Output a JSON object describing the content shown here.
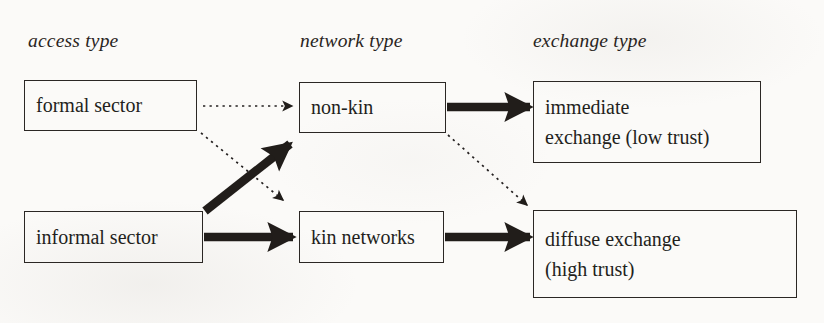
{
  "figure": {
    "background_color": "#fbfaf8",
    "ink_color": "#231f1c"
  },
  "columns": [
    {
      "label": "access type",
      "name": "access-type"
    },
    {
      "label": "network type",
      "name": "network-type"
    },
    {
      "label": "exchange type",
      "name": "exchange-type"
    }
  ],
  "nodes": [
    {
      "id": "formal-sector",
      "lines": [
        "formal sector"
      ],
      "column": "access type"
    },
    {
      "id": "informal-sector",
      "lines": [
        "informal sector"
      ],
      "column": "access type"
    },
    {
      "id": "non-kin",
      "lines": [
        "non-kin"
      ],
      "column": "network type"
    },
    {
      "id": "kin-networks",
      "lines": [
        "kin networks"
      ],
      "column": "network type"
    },
    {
      "id": "immediate-exchange",
      "lines": [
        "immediate",
        "exchange (low trust)"
      ],
      "column": "exchange type"
    },
    {
      "id": "diffuse-exchange",
      "lines": [
        "diffuse exchange",
        "(high trust)"
      ],
      "column": "exchange type"
    }
  ],
  "edges": [
    {
      "id": "formal-to-nonkin",
      "from": "formal sector",
      "to": "non-kin",
      "style": "dotted",
      "weight": "thin"
    },
    {
      "id": "formal-to-kin",
      "from": "formal sector",
      "to": "kin networks",
      "style": "dotted",
      "weight": "thin"
    },
    {
      "id": "informal-to-nonkin",
      "from": "informal sector",
      "to": "non-kin",
      "style": "solid",
      "weight": "thick"
    },
    {
      "id": "informal-to-kin",
      "from": "informal sector",
      "to": "kin networks",
      "style": "solid",
      "weight": "thick"
    },
    {
      "id": "nonkin-to-immediate",
      "from": "non-kin",
      "to": "immediate exchange (low trust)",
      "style": "solid",
      "weight": "thick"
    },
    {
      "id": "nonkin-to-diffuse",
      "from": "non-kin",
      "to": "diffuse exchange (high trust)",
      "style": "dotted",
      "weight": "thin"
    },
    {
      "id": "kin-to-diffuse",
      "from": "kin networks",
      "to": "diffuse exchange (high trust)",
      "style": "solid",
      "weight": "thick"
    }
  ]
}
